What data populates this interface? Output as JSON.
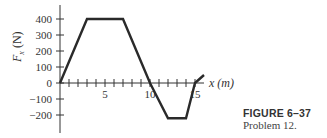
{
  "chart_data": {
    "type": "line",
    "title": "",
    "xlabel": "x (m)",
    "ylabel": "F_x (N)",
    "x": [
      0,
      3,
      7,
      10,
      12,
      14,
      15,
      16
    ],
    "series": [
      {
        "name": "F_x",
        "values": [
          0,
          400,
          400,
          0,
          -220,
          -220,
          0,
          50
        ]
      }
    ],
    "x_ticks": [
      1,
      2,
      3,
      4,
      5,
      6,
      7,
      8,
      9,
      10,
      11,
      12,
      13,
      14,
      15
    ],
    "x_tick_labels": [
      "5",
      "10",
      "15"
    ],
    "y_ticks": [
      400,
      300,
      200,
      100,
      0,
      -100,
      -200
    ],
    "y_tick_labels": [
      "400",
      "300",
      "200",
      "100",
      "0",
      "−100",
      "−200"
    ],
    "xlim": [
      0,
      16
    ],
    "ylim": [
      -300,
      500
    ],
    "grid": false,
    "legend": null
  },
  "axis": {
    "x_title": "x (m)",
    "y_title": "F",
    "y_title_sub": "x",
    "y_title_unit": " (N)"
  },
  "caption": {
    "figure": "FIGURE 6–37",
    "problem": "Problem 12."
  }
}
